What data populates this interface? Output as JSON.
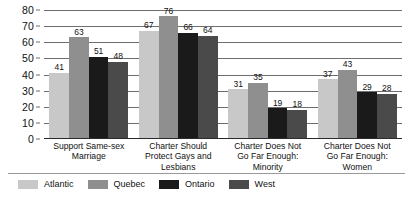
{
  "chart_data": {
    "type": "bar",
    "title": "",
    "subtitle": "",
    "xlabel": "",
    "ylabel": "",
    "ylim": [
      0,
      80
    ],
    "yticks": [
      0,
      10,
      20,
      30,
      40,
      50,
      60,
      70,
      80
    ],
    "grid": true,
    "legend_position": "bottom-left",
    "orientation": "vertical",
    "grouping": "clustered",
    "categories": [
      "Support Same-sex Marriage",
      "Charter Should Protect Gays and Lesbians",
      "Charter Does Not Go Far Enough: Minority",
      "Charter Does Not Go Far Enough: Women"
    ],
    "category_lines": [
      [
        "Support Same-sex",
        "Marriage"
      ],
      [
        "Charter Should",
        "Protect Gays and",
        "Lesbians"
      ],
      [
        "Charter Does Not",
        "Go Far Enough:",
        "Minority"
      ],
      [
        "Charter Does Not",
        "Go Far Enough:",
        "Women"
      ]
    ],
    "series": [
      {
        "name": "Atlantic",
        "color": "#c8c8c8",
        "values": [
          41,
          67,
          31,
          37
        ]
      },
      {
        "name": "Quebec",
        "color": "#8f8f8f",
        "values": [
          63,
          76,
          35,
          43
        ]
      },
      {
        "name": "Ontario",
        "color": "#1a1a1a",
        "values": [
          51,
          66,
          19,
          29
        ]
      },
      {
        "name": "West",
        "color": "#4a4a4a",
        "values": [
          48,
          64,
          18,
          28
        ]
      }
    ]
  }
}
